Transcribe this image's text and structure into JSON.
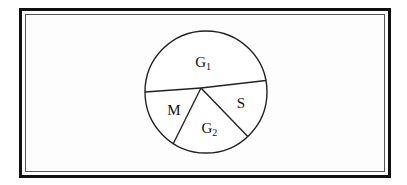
{
  "chart_data": {
    "type": "pie",
    "title": "",
    "note": "Unlabeled proportional diagram; sector shares are estimated from the drawn boundary angles (no numeric values are printed).",
    "start_angle_deg": 180,
    "direction": "clockwise",
    "slices": [
      {
        "label": "G",
        "subscript": "1",
        "display": "G₁",
        "value": 47
      },
      {
        "label": "S",
        "subscript": "",
        "display": "S",
        "value": 16
      },
      {
        "label": "G",
        "subscript": "2",
        "display": "G₂",
        "value": 21
      },
      {
        "label": "M",
        "subscript": "",
        "display": "M",
        "value": 16
      }
    ],
    "units": "percent (estimated)",
    "legend": "none",
    "grid": false
  },
  "frame": {
    "style": "double-border",
    "outer_color": "#111111",
    "inner_color": "#555555"
  },
  "colors": {
    "stroke": "#222222",
    "fill": "#ffffff"
  }
}
